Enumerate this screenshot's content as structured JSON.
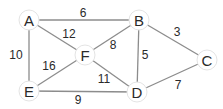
{
  "graph": {
    "nodes": [
      {
        "id": "A",
        "label": "A",
        "x": 29,
        "y": 20
      },
      {
        "id": "B",
        "label": "B",
        "x": 139,
        "y": 20
      },
      {
        "id": "C",
        "label": "C",
        "x": 207,
        "y": 60
      },
      {
        "id": "D",
        "label": "D",
        "x": 137,
        "y": 92
      },
      {
        "id": "E",
        "label": "E",
        "x": 29,
        "y": 91
      },
      {
        "id": "F",
        "label": "F",
        "x": 85,
        "y": 55
      }
    ],
    "edges": [
      {
        "from": "A",
        "to": "B",
        "weight": "6",
        "lx": 83,
        "ly": 13
      },
      {
        "from": "A",
        "to": "F",
        "weight": "12",
        "lx": 69,
        "ly": 34
      },
      {
        "from": "A",
        "to": "E",
        "weight": "10",
        "lx": 16,
        "ly": 55
      },
      {
        "from": "B",
        "to": "F",
        "weight": "8",
        "lx": 113,
        "ly": 45
      },
      {
        "from": "B",
        "to": "D",
        "weight": "5",
        "lx": 145,
        "ly": 55
      },
      {
        "from": "B",
        "to": "C",
        "weight": "3",
        "lx": 177,
        "ly": 32
      },
      {
        "from": "F",
        "to": "E",
        "weight": "16",
        "lx": 49,
        "ly": 66
      },
      {
        "from": "F",
        "to": "D",
        "weight": "11",
        "lx": 104,
        "ly": 79
      },
      {
        "from": "E",
        "to": "D",
        "weight": "9",
        "lx": 78,
        "ly": 100
      },
      {
        "from": "D",
        "to": "C",
        "weight": "7",
        "lx": 178,
        "ly": 85
      }
    ]
  }
}
